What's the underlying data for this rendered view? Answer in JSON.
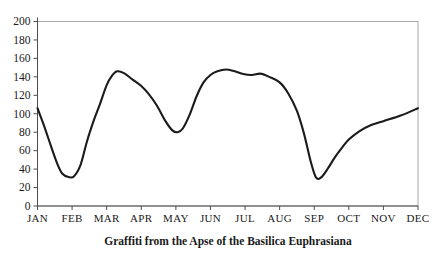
{
  "chart_data": {
    "type": "line",
    "title": "Graffiti from the Apse of the Basilica Euphrasiana",
    "categories": [
      "JAN",
      "FEB",
      "MAR",
      "APR",
      "MAY",
      "JUN",
      "JUL",
      "AUG",
      "SEP",
      "OCT",
      "NOV",
      "DEC"
    ],
    "values": [
      106,
      32,
      131,
      130,
      80,
      142,
      143,
      134,
      31,
      72,
      92,
      106
    ],
    "xlabel": "",
    "ylabel": "",
    "ylim": [
      0,
      200
    ],
    "y_ticks": [
      0,
      20,
      40,
      60,
      80,
      100,
      120,
      140,
      160,
      180,
      200
    ],
    "grid": false,
    "legend": "none",
    "line_color": "#1b1b1b",
    "frame_color": "#a9a9a9",
    "axis_color": "#4d4d4d",
    "text_color": "#1a1a1a",
    "background_color": "#ffffff",
    "curve_samples_month_value": [
      [
        0.0,
        106
      ],
      [
        0.18,
        88
      ],
      [
        0.38,
        66
      ],
      [
        0.57,
        46
      ],
      [
        0.72,
        35
      ],
      [
        0.9,
        31.5
      ],
      [
        1.05,
        32
      ],
      [
        1.24,
        44
      ],
      [
        1.43,
        70
      ],
      [
        1.63,
        93
      ],
      [
        1.8,
        110
      ],
      [
        2.0,
        131
      ],
      [
        2.15,
        141
      ],
      [
        2.3,
        146
      ],
      [
        2.5,
        144
      ],
      [
        2.75,
        137
      ],
      [
        3.0,
        130
      ],
      [
        3.2,
        122
      ],
      [
        3.45,
        109
      ],
      [
        3.7,
        92
      ],
      [
        3.9,
        82
      ],
      [
        4.05,
        80
      ],
      [
        4.2,
        84
      ],
      [
        4.4,
        99
      ],
      [
        4.6,
        119
      ],
      [
        4.8,
        134
      ],
      [
        5.0,
        142
      ],
      [
        5.2,
        146
      ],
      [
        5.45,
        148
      ],
      [
        5.7,
        146
      ],
      [
        5.95,
        143
      ],
      [
        6.2,
        142
      ],
      [
        6.45,
        143.5
      ],
      [
        6.7,
        140
      ],
      [
        7.0,
        134
      ],
      [
        7.25,
        122
      ],
      [
        7.5,
        103
      ],
      [
        7.7,
        79
      ],
      [
        7.9,
        48
      ],
      [
        8.05,
        31
      ],
      [
        8.2,
        31
      ],
      [
        8.4,
        41
      ],
      [
        8.6,
        53
      ],
      [
        8.8,
        63
      ],
      [
        9.0,
        72
      ],
      [
        9.3,
        81
      ],
      [
        9.6,
        87
      ],
      [
        10.0,
        92
      ],
      [
        10.5,
        98
      ],
      [
        11.0,
        106
      ]
    ]
  }
}
